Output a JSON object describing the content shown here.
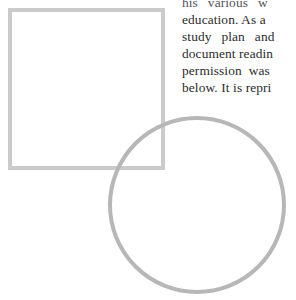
{
  "page": {
    "kind": "scanned-book-page-fragment",
    "background_color": "#ffffff",
    "width": 296,
    "height": 300
  },
  "text_column": {
    "name": "body-text-column",
    "text_color": "#2b2b2b",
    "lines": [
      {
        "text": "his various w",
        "clipped_top": true,
        "clipped_right": true,
        "spacing": "wide"
      },
      {
        "text": "education. As a",
        "clipped_right": true,
        "spacing": "normal"
      },
      {
        "text": "study plan and",
        "clipped_right": true,
        "spacing": "wide"
      },
      {
        "text": "document readin",
        "clipped_right": true,
        "spacing": "normal"
      },
      {
        "text": "permission was",
        "clipped_right": true,
        "spacing": "wide"
      },
      {
        "text": "below. It is repri",
        "clipped_right": true,
        "spacing": "normal"
      }
    ]
  },
  "figure": {
    "name": "geometric-figure",
    "stroke_color_square": "#c9c9c9",
    "stroke_color_circle": "#b5b5b5",
    "fill_color": "#ffffff",
    "shapes": [
      {
        "name": "square-outline",
        "type": "rect",
        "x": 8,
        "y": 8,
        "width": 157,
        "height": 162,
        "stroke_width": 4
      },
      {
        "name": "circle-outline",
        "type": "circle",
        "cx": 197,
        "cy": 205,
        "r": 89,
        "stroke_width": 4
      }
    ]
  }
}
